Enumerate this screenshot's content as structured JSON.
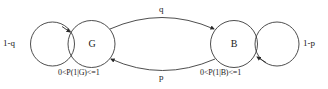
{
  "diagram": {
    "type": "state-transition-diagram",
    "stroke_color": "#3a3a3a",
    "text_color": "#1a1a1a",
    "background_color": "#ffffff",
    "states": [
      {
        "id": "G",
        "label": "G",
        "condition_label": "0<P(1|G)<=1",
        "self_loop_label": "1-q"
      },
      {
        "id": "B",
        "label": "B",
        "condition_label": "0<P(1|B)<=1",
        "self_loop_label": "1-p"
      }
    ],
    "transitions": [
      {
        "id": "g-to-b",
        "from": "G",
        "to": "B",
        "label": "q",
        "position": "top"
      },
      {
        "id": "b-to-g",
        "from": "B",
        "to": "G",
        "label": "p",
        "position": "bottom"
      }
    ]
  }
}
